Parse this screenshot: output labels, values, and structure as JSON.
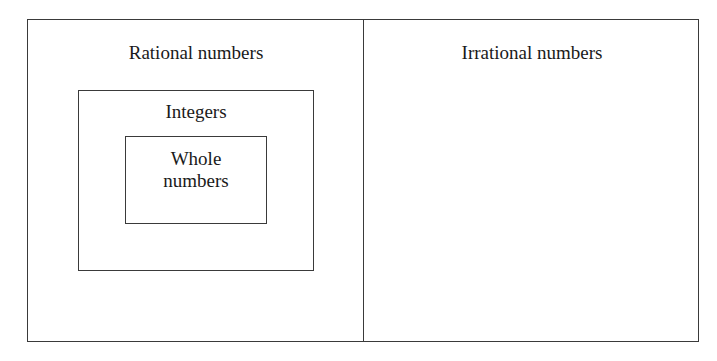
{
  "diagram": {
    "title": "",
    "sets": {
      "rational": {
        "label": "Rational numbers"
      },
      "irrational": {
        "label": "Irrational numbers"
      },
      "integers": {
        "label": "Integers"
      },
      "whole": {
        "label_line1": "Whole",
        "label_line2": "numbers"
      }
    },
    "relationships": [
      {
        "child": "Whole numbers",
        "parent": "Integers"
      },
      {
        "child": "Integers",
        "parent": "Rational numbers"
      },
      {
        "disjoint": [
          "Rational numbers",
          "Irrational numbers"
        ]
      }
    ],
    "colors": {
      "line": "#3a3a3a",
      "text": "#1a1a1a",
      "background": "#ffffff"
    }
  }
}
